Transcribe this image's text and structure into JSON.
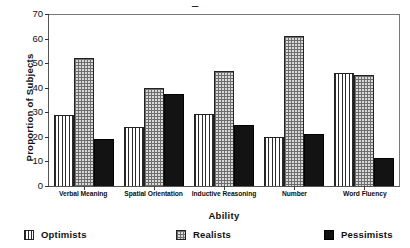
{
  "chart_data": {
    "type": "bar",
    "title": "Type",
    "xlabel": "Ability",
    "ylabel": "Proportion of Subjects",
    "ylim": [
      0,
      70
    ],
    "yticks": [
      0,
      10,
      20,
      30,
      40,
      50,
      60,
      70
    ],
    "grid": false,
    "legend_position": "bottom",
    "categories": [
      "Verbal Meaning",
      "Spatial Orientation",
      "Inductive Reasoning",
      "Number",
      "Word Fluency"
    ],
    "series": [
      {
        "name": "Optimists",
        "pattern": "vertical-lines",
        "color": "#ffffff",
        "values": [
          29,
          24,
          29.5,
          20,
          46
        ]
      },
      {
        "name": "Realists",
        "pattern": "cross-hatch",
        "color": "#d9d9d9",
        "values": [
          52,
          40,
          47,
          61,
          45
        ]
      },
      {
        "name": "Pessimists",
        "pattern": "solid",
        "color": "#131313",
        "values": [
          19,
          37.5,
          25,
          21,
          11.5
        ]
      }
    ]
  }
}
